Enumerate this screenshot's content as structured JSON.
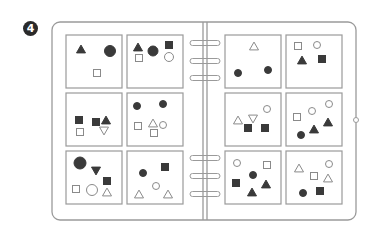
{
  "badge": {
    "label": "4"
  },
  "colors": {
    "stroke": "#8a8a8a",
    "fill": "#3a3a3a",
    "paper": "#ffffff",
    "frame": "#9a9a9a"
  },
  "binder": {
    "left_page": {
      "cards": [
        {
          "id": "L1",
          "shapes": [
            {
              "type": "triangle",
              "filled": true,
              "x": 15,
              "y": 14,
              "s": 9
            },
            {
              "type": "circle",
              "filled": true,
              "x": 44,
              "y": 16,
              "s": 11
            },
            {
              "type": "square",
              "filled": false,
              "x": 31,
              "y": 38,
              "s": 7
            }
          ]
        },
        {
          "id": "L2",
          "shapes": [
            {
              "type": "triangle",
              "filled": true,
              "x": 11,
              "y": 12,
              "s": 9
            },
            {
              "type": "circle",
              "filled": true,
              "x": 26,
              "y": 16,
              "s": 10
            },
            {
              "type": "square",
              "filled": true,
              "x": 42,
              "y": 10,
              "s": 7
            },
            {
              "type": "square",
              "filled": false,
              "x": 12,
              "y": 23,
              "s": 7
            },
            {
              "type": "circle",
              "filled": false,
              "x": 42,
              "y": 22,
              "s": 9
            }
          ]
        },
        {
          "id": "L3",
          "shapes": [
            {
              "type": "square",
              "filled": true,
              "x": 13,
              "y": 27,
              "s": 7
            },
            {
              "type": "square",
              "filled": true,
              "x": 30,
              "y": 29,
              "s": 7
            },
            {
              "type": "triangle",
              "filled": true,
              "x": 40,
              "y": 27,
              "s": 9
            },
            {
              "type": "square",
              "filled": false,
              "x": 14,
              "y": 39,
              "s": 7
            },
            {
              "type": "triangle-down",
              "filled": false,
              "x": 38,
              "y": 38,
              "s": 9
            }
          ]
        },
        {
          "id": "L4",
          "shapes": [
            {
              "type": "circle",
              "filled": true,
              "x": 10,
              "y": 13,
              "s": 7
            },
            {
              "type": "circle",
              "filled": true,
              "x": 36,
              "y": 11,
              "s": 7
            },
            {
              "type": "square",
              "filled": false,
              "x": 11,
              "y": 33,
              "s": 7
            },
            {
              "type": "triangle",
              "filled": false,
              "x": 26,
              "y": 30,
              "s": 9
            },
            {
              "type": "circle",
              "filled": false,
              "x": 36,
              "y": 32,
              "s": 7
            },
            {
              "type": "square",
              "filled": false,
              "x": 27,
              "y": 40,
              "s": 7
            }
          ]
        },
        {
          "id": "L5",
          "shapes": [
            {
              "type": "circle",
              "filled": true,
              "x": 14,
              "y": 12,
              "s": 12
            },
            {
              "type": "triangle-down",
              "filled": true,
              "x": 30,
              "y": 20,
              "s": 9
            },
            {
              "type": "square",
              "filled": true,
              "x": 41,
              "y": 30,
              "s": 7
            },
            {
              "type": "square",
              "filled": false,
              "x": 10,
              "y": 38,
              "s": 7
            },
            {
              "type": "circle",
              "filled": false,
              "x": 26,
              "y": 39,
              "s": 11
            },
            {
              "type": "triangle",
              "filled": false,
              "x": 41,
              "y": 41,
              "s": 9
            }
          ]
        },
        {
          "id": "L6",
          "shapes": [
            {
              "type": "circle",
              "filled": true,
              "x": 16,
              "y": 22,
              "s": 7
            },
            {
              "type": "square",
              "filled": true,
              "x": 38,
              "y": 16,
              "s": 7
            },
            {
              "type": "circle",
              "filled": false,
              "x": 29,
              "y": 35,
              "s": 7
            },
            {
              "type": "triangle",
              "filled": false,
              "x": 12,
              "y": 43,
              "s": 9
            },
            {
              "type": "triangle",
              "filled": false,
              "x": 41,
              "y": 43,
              "s": 9
            }
          ]
        }
      ]
    },
    "right_page": {
      "cards": [
        {
          "id": "R1",
          "shapes": [
            {
              "type": "triangle",
              "filled": false,
              "x": 29,
              "y": 11,
              "s": 9
            },
            {
              "type": "circle",
              "filled": true,
              "x": 13,
              "y": 38,
              "s": 7
            },
            {
              "type": "circle",
              "filled": true,
              "x": 43,
              "y": 35,
              "s": 7
            }
          ]
        },
        {
          "id": "R2",
          "shapes": [
            {
              "type": "square",
              "filled": false,
              "x": 12,
              "y": 11,
              "s": 7
            },
            {
              "type": "circle",
              "filled": false,
              "x": 31,
              "y": 10,
              "s": 7
            },
            {
              "type": "triangle",
              "filled": true,
              "x": 16,
              "y": 25,
              "s": 9
            },
            {
              "type": "square",
              "filled": true,
              "x": 36,
              "y": 24,
              "s": 7
            }
          ]
        },
        {
          "id": "R3",
          "shapes": [
            {
              "type": "circle",
              "filled": false,
              "x": 42,
              "y": 16,
              "s": 7
            },
            {
              "type": "triangle",
              "filled": false,
              "x": 13,
              "y": 27,
              "s": 9
            },
            {
              "type": "triangle-down",
              "filled": false,
              "x": 28,
              "y": 26,
              "s": 9
            },
            {
              "type": "square",
              "filled": true,
              "x": 23,
              "y": 35,
              "s": 7
            },
            {
              "type": "square",
              "filled": true,
              "x": 40,
              "y": 35,
              "s": 7
            }
          ]
        },
        {
          "id": "R4",
          "shapes": [
            {
              "type": "circle",
              "filled": false,
              "x": 43,
              "y": 11,
              "s": 7
            },
            {
              "type": "circle",
              "filled": false,
              "x": 26,
              "y": 18,
              "s": 7
            },
            {
              "type": "square",
              "filled": false,
              "x": 11,
              "y": 24,
              "s": 7
            },
            {
              "type": "triangle",
              "filled": true,
              "x": 42,
              "y": 29,
              "s": 9
            },
            {
              "type": "triangle",
              "filled": true,
              "x": 28,
              "y": 36,
              "s": 9
            },
            {
              "type": "circle",
              "filled": true,
              "x": 15,
              "y": 42,
              "s": 7
            }
          ]
        },
        {
          "id": "R5",
          "shapes": [
            {
              "type": "circle",
              "filled": false,
              "x": 12,
              "y": 12,
              "s": 7
            },
            {
              "type": "square",
              "filled": false,
              "x": 42,
              "y": 14,
              "s": 7
            },
            {
              "type": "circle",
              "filled": true,
              "x": 28,
              "y": 24,
              "s": 7
            },
            {
              "type": "square",
              "filled": true,
              "x": 11,
              "y": 32,
              "s": 7
            },
            {
              "type": "triangle",
              "filled": true,
              "x": 41,
              "y": 33,
              "s": 9
            },
            {
              "type": "triangle",
              "filled": true,
              "x": 27,
              "y": 41,
              "s": 9
            }
          ]
        },
        {
          "id": "R6",
          "shapes": [
            {
              "type": "triangle",
              "filled": false,
              "x": 13,
              "y": 17,
              "s": 9
            },
            {
              "type": "circle",
              "filled": false,
              "x": 43,
              "y": 13,
              "s": 7
            },
            {
              "type": "square",
              "filled": false,
              "x": 28,
              "y": 25,
              "s": 7
            },
            {
              "type": "triangle",
              "filled": false,
              "x": 42,
              "y": 27,
              "s": 9
            },
            {
              "type": "circle",
              "filled": true,
              "x": 17,
              "y": 42,
              "s": 7
            },
            {
              "type": "square",
              "filled": true,
              "x": 34,
              "y": 40,
              "s": 7
            }
          ]
        }
      ]
    },
    "rings_y": [
      43,
      61,
      78,
      158,
      176,
      194
    ]
  }
}
